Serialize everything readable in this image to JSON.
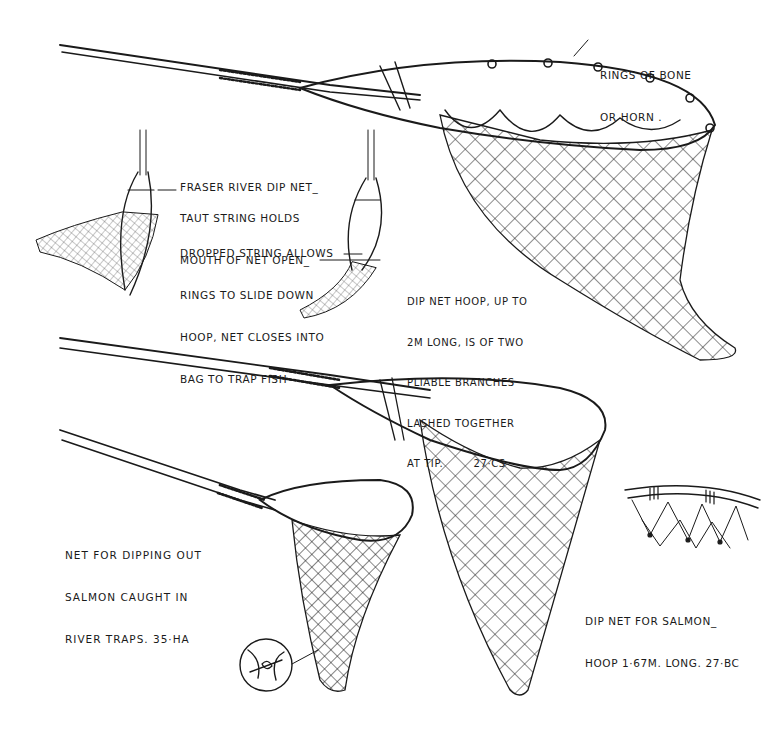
{
  "labels": {
    "rings": {
      "lines": [
        "RINGS OF BONE",
        "OR HORN ."
      ]
    },
    "title": {
      "lines": [
        "FRASER RIVER DIP NET_"
      ]
    },
    "taut": {
      "lines": [
        "TAUT STRING HOLDS",
        "MOUTH OF NET OPEN_"
      ]
    },
    "dropped": {
      "lines": [
        "DROPPED STRING ALLOWS",
        "RINGS TO SLIDE DOWN",
        "HOOP, NET CLOSES INTO",
        "BAG TO TRAP FISH"
      ]
    },
    "hoop": {
      "lines": [
        "DIP NET HOOP, UP TO",
        "2m LONG, IS OF TWO",
        "PLIABLE BRANCHES",
        "LASHED TOGETHER",
        "AT TIP.        27·CS"
      ]
    },
    "salmon_trap": {
      "lines": [
        "NET FOR DIPPING OUT",
        "SALMON CAUGHT IN",
        "RIVER TRAPS. 35·HA"
      ]
    },
    "salmon_net": {
      "lines": [
        "DIP NET FOR SALMON_",
        "HOOP 1·67m. LONG. 27·BC"
      ]
    }
  },
  "figures": [
    {
      "id": "fraser-dip-net",
      "description": "Large dip net with rings of bone or horn sliding on hoop"
    },
    {
      "id": "open-net-small",
      "description": "Small view: taut string holds mouth open"
    },
    {
      "id": "closed-net-small",
      "description": "Small view: dropped string closes net"
    },
    {
      "id": "salmon-dip-net",
      "description": "Long-handled dip net for salmon"
    },
    {
      "id": "trap-dip-net",
      "description": "Net for dipping out salmon from river traps"
    },
    {
      "id": "knot-detail",
      "description": "Circular inset showing net knot"
    },
    {
      "id": "hoop-lashing-detail",
      "description": "Detail of net lashed to hoop"
    }
  ],
  "colors": {
    "ink": "#1a1a1a",
    "paper": "#ffffff"
  }
}
